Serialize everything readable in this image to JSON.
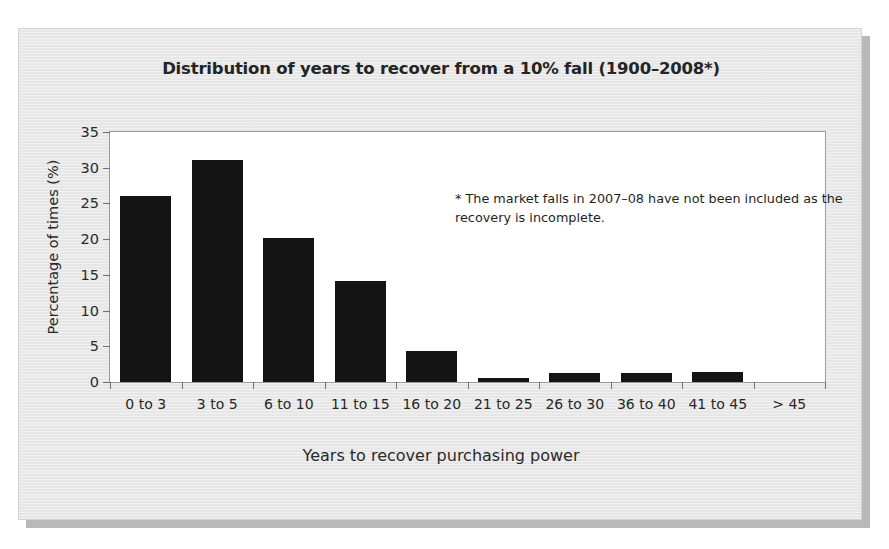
{
  "chart_data": {
    "type": "bar",
    "title": "Distribution of years to recover from a 10% fall (1900–2008*)",
    "xlabel": "Years to recover purchasing power",
    "ylabel": "Percentage of times (%)",
    "categories": [
      "0 to 3",
      "3 to 5",
      "6 to 10",
      "11 to 15",
      "16 to 20",
      "21 to 25",
      "26 to 30",
      "36 to 40",
      "41 to 45",
      "> 45"
    ],
    "values": [
      26.0,
      31.1,
      20.1,
      14.2,
      4.3,
      0.5,
      1.3,
      1.3,
      1.4,
      0.0
    ],
    "ylim": [
      0,
      35
    ],
    "yticks": [
      0,
      5,
      10,
      15,
      20,
      25,
      30,
      35
    ],
    "ytick_labels": [
      "0",
      "5",
      "10",
      "15",
      "20",
      "25",
      "30",
      "35"
    ],
    "grid": false,
    "legend": null,
    "annotations": [
      {
        "text": "* The market falls in 2007–08 have not been included as the recovery is incomplete.",
        "position": "inside-plot-top-right"
      }
    ],
    "bar_color": "#141414",
    "plot_background": "#ffffff",
    "figure_background": "#e9e9e9"
  },
  "figure": {
    "title": "Distribution of years to recover from a 10% fall (1900–2008*)",
    "x_axis_title": "Years to recover purchasing power",
    "y_axis_title": "Percentage of times (%)",
    "footnote": "* The market falls in 2007–08 have not been included as the recovery is incomplete."
  }
}
